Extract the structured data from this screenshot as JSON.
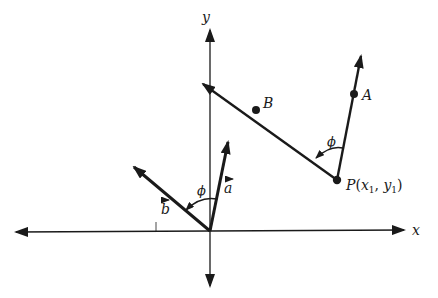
{
  "figure": {
    "type": "vector-angle-diagram",
    "axes": {
      "x_label": "x",
      "y_label": "y"
    },
    "origin_vectors": {
      "a_label": "a",
      "b_label": "b",
      "angle_label": "ϕ"
    },
    "point_lines": {
      "point_P_label": "P(x₁, y₁)",
      "P_text": "P",
      "P_args_open": "(",
      "x1": "x",
      "sub1a": "1",
      "comma": ", ",
      "y1": "y",
      "sub1b": "1",
      "P_args_close": ")",
      "point_A_label": "A",
      "point_B_label": "B",
      "angle_label": "ϕ"
    },
    "colors": {
      "ink": "#1a1a1a",
      "background": "#ffffff"
    }
  }
}
